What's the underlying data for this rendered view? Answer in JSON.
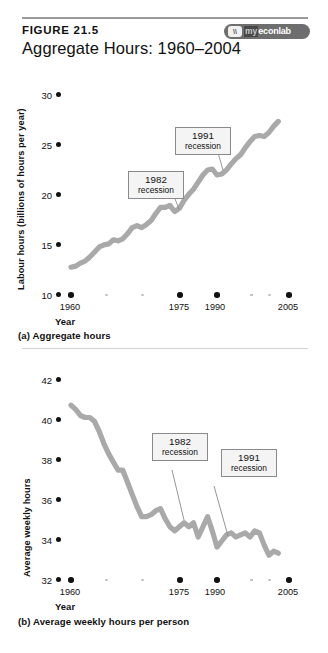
{
  "header": {
    "figure_number": "FIGURE 21.5",
    "title": "Aggregate Hours: 1960–2004",
    "logo": {
      "mark": "\\\\",
      "my": "my",
      "name": "econlab",
      "full": "myeconlab"
    }
  },
  "panels": [
    {
      "id": "a",
      "caption": "(a) Aggregate hours",
      "ylabel": "Labour hours (billions of hours per year)",
      "xlabel": "Year",
      "yticks": [
        "10",
        "15",
        "20",
        "25",
        "30"
      ],
      "xticks": [
        "1960",
        "1975",
        "1990",
        "2005"
      ],
      "callouts": [
        {
          "year": "1982",
          "word": "recession"
        },
        {
          "year": "1991",
          "word": "recession"
        }
      ]
    },
    {
      "id": "b",
      "caption": "(b) Average weekly hours per person",
      "ylabel": "Average weekly hours",
      "xlabel": "Year",
      "yticks": [
        "32",
        "34",
        "36",
        "38",
        "40",
        "42"
      ],
      "xticks": [
        "1960",
        "1975",
        "1990",
        "2005"
      ],
      "callouts": [
        {
          "year": "1982",
          "word": "recession"
        },
        {
          "year": "1991",
          "word": "recession"
        }
      ]
    }
  ],
  "colors": {
    "line": "#a9a9a9",
    "tick": "#111111",
    "minor_tick": "#c2c2c2",
    "callout_bg": "#f4f4f4",
    "callout_border": "#8a8a8a",
    "brand_bg": "#6e6e6e"
  },
  "chart_data": [
    {
      "type": "line",
      "id": "a",
      "title": "Aggregate Hours: 1960–2004",
      "subtitle": "(a) Aggregate hours",
      "xlabel": "Year",
      "ylabel": "Labour hours (billions of hours per year)",
      "xlim": [
        1958,
        2007
      ],
      "ylim": [
        10,
        30
      ],
      "xticks": [
        1960,
        1975,
        1990,
        2005
      ],
      "yticks": [
        10,
        15,
        20,
        25,
        30
      ],
      "grid": false,
      "legend": "none",
      "annotations": [
        {
          "text": "1982 recession",
          "points_to_x": 1982,
          "points_to_y": 19.4
        },
        {
          "text": "1991 recession",
          "points_to_x": 1991,
          "points_to_y": 22.9
        }
      ],
      "series": [
        {
          "name": "Aggregate hours",
          "x": [
            1960,
            1961,
            1962,
            1963,
            1964,
            1965,
            1966,
            1967,
            1968,
            1969,
            1970,
            1971,
            1972,
            1973,
            1974,
            1975,
            1976,
            1977,
            1978,
            1979,
            1980,
            1981,
            1982,
            1983,
            1984,
            1985,
            1986,
            1987,
            1988,
            1989,
            1990,
            1991,
            1992,
            1993,
            1994,
            1995,
            1996,
            1997,
            1998,
            1999,
            2000,
            2001,
            2002,
            2003,
            2004
          ],
          "values": [
            12.7,
            12.8,
            13.1,
            13.3,
            13.7,
            14.2,
            14.7,
            14.9,
            15.0,
            15.4,
            15.3,
            15.5,
            16.0,
            16.6,
            16.8,
            16.6,
            16.9,
            17.3,
            18.0,
            18.6,
            18.6,
            18.8,
            18.2,
            18.5,
            19.3,
            19.9,
            20.4,
            21.1,
            21.8,
            22.3,
            22.4,
            21.8,
            21.9,
            22.3,
            22.9,
            23.4,
            23.8,
            24.5,
            25.1,
            25.6,
            25.7,
            25.6,
            26.0,
            26.6,
            27.1
          ]
        }
      ]
    },
    {
      "type": "line",
      "id": "b",
      "title": "Average weekly hours per person",
      "subtitle": "(b) Average weekly hours per person",
      "xlabel": "Year",
      "ylabel": "Average weekly hours",
      "xlim": [
        1958,
        2007
      ],
      "ylim": [
        32,
        42
      ],
      "xticks": [
        1960,
        1975,
        1990,
        2005
      ],
      "yticks": [
        32,
        34,
        36,
        38,
        40,
        42
      ],
      "grid": false,
      "legend": "none",
      "annotations": [
        {
          "text": "1982 recession",
          "points_to_x": 1982,
          "points_to_y": 34.5
        },
        {
          "text": "1991 recession",
          "points_to_x": 1991,
          "points_to_y": 33.6
        }
      ],
      "series": [
        {
          "name": "Average weekly hours",
          "x": [
            1960,
            1961,
            1962,
            1963,
            1964,
            1965,
            1966,
            1967,
            1968,
            1969,
            1970,
            1971,
            1972,
            1973,
            1974,
            1975,
            1976,
            1977,
            1978,
            1979,
            1980,
            1981,
            1982,
            1983,
            1984,
            1985,
            1986,
            1987,
            1988,
            1989,
            1990,
            1991,
            1992,
            1993,
            1994,
            1995,
            1996,
            1997,
            1998,
            1999,
            2000,
            2001,
            2002,
            2003,
            2004
          ],
          "values": [
            40.6,
            40.4,
            40.1,
            40.0,
            40.0,
            39.8,
            39.3,
            38.7,
            38.2,
            37.8,
            37.4,
            37.4,
            36.8,
            36.2,
            35.6,
            35.1,
            35.1,
            35.2,
            35.4,
            35.5,
            35.0,
            34.6,
            34.4,
            34.6,
            34.8,
            34.6,
            34.8,
            34.1,
            34.6,
            35.1,
            34.4,
            33.6,
            33.9,
            34.2,
            34.3,
            34.1,
            34.2,
            34.3,
            34.1,
            34.4,
            34.3,
            33.7,
            33.2,
            33.4,
            33.3
          ]
        }
      ]
    }
  ]
}
